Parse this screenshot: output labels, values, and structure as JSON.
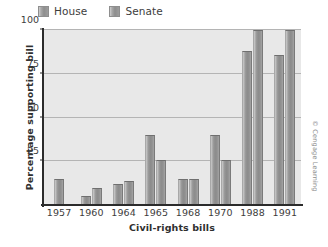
{
  "chart_data": {
    "type": "bar",
    "title": "",
    "xlabel": "Civil-rights bills",
    "ylabel": "Percentage supporting bill",
    "categories": [
      "1957",
      "1960",
      "1964",
      "1965",
      "1968",
      "1970",
      "1988",
      "1991"
    ],
    "series": [
      {
        "name": "House",
        "values": [
          0,
          5,
          12,
          40,
          15,
          40,
          88,
          86
        ]
      },
      {
        "name": "Senate",
        "values": [
          15,
          10,
          14,
          26,
          15,
          26,
          100,
          100
        ]
      }
    ],
    "ylim": [
      0,
      100
    ],
    "yticks": [
      25,
      50,
      75,
      100
    ],
    "ytick_labels": [
      "25",
      "50",
      "75",
      "100"
    ],
    "grid": true,
    "legend_position": "top-left",
    "bar_color": "#949494",
    "plot_background": "#e8e8e8"
  },
  "legend": {
    "entries": [
      {
        "label": "House",
        "swatch": "house-swatch"
      },
      {
        "label": "Senate",
        "swatch": "senate-swatch"
      }
    ]
  },
  "credit": {
    "text": "© Cengage Learning"
  }
}
